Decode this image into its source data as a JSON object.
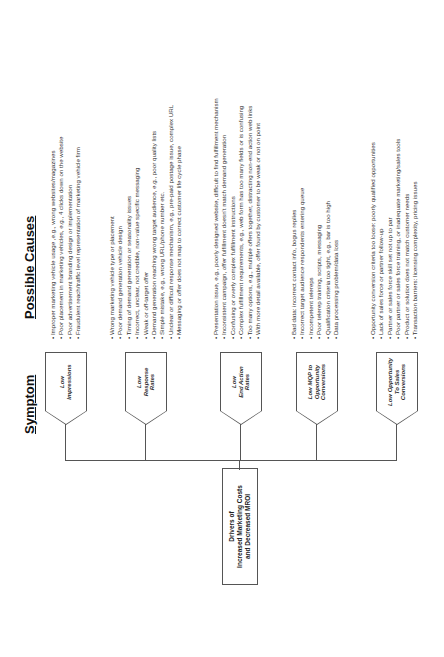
{
  "headers": {
    "symptom": "Symptom",
    "possible_causes": "Possible Causes"
  },
  "root": {
    "label": "Drivers of\nIncreased Marketing Costs\nand Decreased MROI"
  },
  "symptoms": [
    {
      "label": "Low\nImpressions",
      "causes": [
        "Improper marketing vehicle usage ,e.g., wrong websites/magazines",
        "Poor placement in marketing vehicles, e.g., 4 clicks down on the website",
        "Poor advertisement branding design or implementation",
        "Fraudulent reach/traffic level representation of marketing vehicle firm"
      ]
    },
    {
      "label": "Low\nResponse\nRates",
      "causes": [
        "Wrong marketing vehicle type or placement",
        "Poor demand generation vehicle design",
        "Timing of demand generation or seasonality issues",
        "Incorrect, unclear, not credible, non-value specific messaging",
        "Weak or off-target offer",
        "Demand generation reaching wrong target audience, e.g., poor quality lists",
        "Simple mistake, e.g., wrong URL/phone number etc.",
        "Unclear or difficult response mechanism, e.g., pre-paid postage issue, complex URL",
        "Messaging or offer does not map to correct customer life cycle phase"
      ]
    },
    {
      "label": "Low\nEnd Action\nRates",
      "causes": [
        "Presentation issue, e.g., poorly designed website, difficult to find fulfillment mechanism",
        "Inconsistent campaign, offer fulfillment doesn't match demand generation",
        "Confusing or overly complex fulfillment instructions",
        "Complex fulfillment requirements, e.g., web form has too many fields or is confusing",
        "Too many options, e.g., multiple offers together, distracting non-end action web links",
        "With more detail available, offer found by customer to be weak or not on point"
      ]
    },
    {
      "label": "Low MQP to\nOpportunity\nConversions",
      "causes": [
        "Bad data: incorrect contact info, bogus replies",
        "Incorrect target audience respondents entering queue",
        "Incompetent telereps",
        "Poor telerep training, scripts, messaging",
        "Qualification criteria too tight, e.g., bar is too high",
        "Data processing problem/data loss"
      ]
    },
    {
      "label": "Low Opportunity\nTo Sales\nConversions",
      "causes": [
        "Opportunity conversion criteria too loose: poorly qualified opportunities",
        "Lack of sales force or partner follow-up",
        "Partner or sales force skill set not up to par",
        "Poor partner or sales force training, or inadequate marketing/sales tools",
        "Product or solution does not match customer needs",
        "Transaction barriers: licensing complexity, pricing issues"
      ]
    }
  ]
}
